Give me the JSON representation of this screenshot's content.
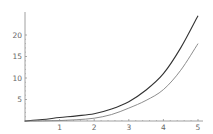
{
  "chart_data": {
    "type": "line",
    "title": "",
    "xlabel": "",
    "ylabel": "",
    "xlim": [
      0,
      5
    ],
    "ylim": [
      0,
      25
    ],
    "grid": false,
    "legend": null,
    "x_ticks": [
      1,
      2,
      3,
      4,
      5
    ],
    "y_ticks": [
      5,
      10,
      15,
      20
    ],
    "x": [
      0,
      0.5,
      1,
      1.5,
      2,
      2.5,
      3,
      3.5,
      4,
      4.5,
      5
    ],
    "series": [
      {
        "name": "upper curve",
        "color": "#333333",
        "values": [
          0,
          0.35,
          0.8,
          1.2,
          1.7,
          2.8,
          4.5,
          7.2,
          11.0,
          17.0,
          24.5
        ]
      },
      {
        "name": "lower curve",
        "color": "#808080",
        "values": [
          0,
          0.02,
          0.1,
          0.3,
          0.65,
          1.5,
          3.0,
          4.8,
          7.3,
          11.8,
          18.0
        ]
      }
    ]
  },
  "axis_color": "#888888",
  "label_color": "#666666"
}
